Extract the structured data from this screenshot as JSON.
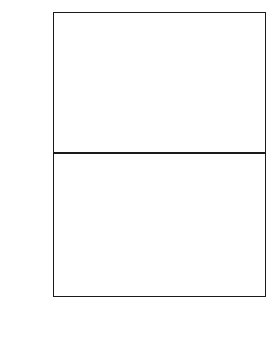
{
  "figure": {
    "xtitle": "Energy",
    "ytitle_top_html": "I<sup>+</sup>+I<sup>-</sup>",
    "ytitle_bottom_html": "(I<sup>+</sup>-I<sup>-</sup>)/(I<sup>+</sup>+I<sup>-</sup>)",
    "background": "#ffffff",
    "curve_color": "#111111",
    "marker_color": "#555555"
  },
  "chart_data": [
    {
      "type": "line",
      "panel": "top",
      "title": "",
      "xlabel": "Energy",
      "ylabel": "I+ + I-",
      "xlim": [
        8.02,
        8.1
      ],
      "ylim": [
        0,
        21500
      ],
      "xticks": [
        8.02,
        8.03,
        8.04,
        8.05,
        8.06,
        8.07,
        8.08,
        8.09,
        8.1
      ],
      "xticklabels": [
        "8.02",
        "8.03",
        "8.04",
        "8.05",
        "8.06",
        "8.07",
        "8.08",
        "8.09",
        "8.10"
      ],
      "yticks": [
        0,
        5000,
        10000,
        15000,
        20000
      ],
      "yticklabels": [
        "0",
        "5000",
        "10000",
        "15000",
        "20000"
      ],
      "minor_ticks_per_major_x": 5,
      "minor_ticks_per_major_y": 2,
      "grid": false,
      "legend": "none",
      "series": [
        {
          "name": "fit",
          "style": "solid-line",
          "x": [
            8.02,
            8.022,
            8.024,
            8.026,
            8.028,
            8.03,
            8.032,
            8.034,
            8.036,
            8.038,
            8.04,
            8.042,
            8.044,
            8.046,
            8.048,
            8.05,
            8.052,
            8.054,
            8.0555,
            8.057,
            8.0585,
            8.06,
            8.0612,
            8.0622,
            8.0632,
            8.0642,
            8.065,
            8.0657,
            8.0663,
            8.0668,
            8.0672,
            8.0676,
            8.068,
            8.0684,
            8.0688,
            8.0692,
            8.0696,
            8.07,
            8.0704,
            8.0708,
            8.0712,
            8.0718,
            8.0724,
            8.073,
            8.0738,
            8.0746,
            8.0755,
            8.0765,
            8.0778,
            8.079,
            8.0805,
            8.082,
            8.084,
            8.086,
            8.088,
            8.09,
            8.093,
            8.096,
            8.099,
            8.1
          ],
          "y": [
            620,
            620,
            625,
            625,
            630,
            630,
            635,
            635,
            640,
            645,
            650,
            660,
            670,
            685,
            705,
            740,
            800,
            930,
            1080,
            1340,
            1800,
            2600,
            3900,
            5200,
            6900,
            8700,
            10100,
            10950,
            11300,
            11450,
            11550,
            11750,
            12100,
            12700,
            13700,
            15200,
            17000,
            18800,
            19900,
            20150,
            19900,
            18600,
            16700,
            14600,
            12200,
            10100,
            8200,
            6400,
            4700,
            3600,
            2700,
            2100,
            1600,
            1300,
            1150,
            1030,
            900,
            830,
            790,
            780
          ]
        },
        {
          "name": "data",
          "style": "open-circles",
          "x": [
            8.0205,
            8.0225,
            8.0245,
            8.0265,
            8.0285,
            8.0305,
            8.0325,
            8.0345,
            8.0365,
            8.0385,
            8.0405,
            8.0425,
            8.0445,
            8.0465,
            8.0485,
            8.0505,
            8.0525,
            8.0545,
            8.0558,
            8.0572,
            8.0588,
            8.0602,
            8.0614,
            8.0624,
            8.0634,
            8.0644,
            8.0652,
            8.0659,
            8.0665,
            8.067,
            8.0674,
            8.0678,
            8.0682,
            8.0686,
            8.069,
            8.0694,
            8.0698,
            8.0702,
            8.0706,
            8.071,
            8.0715,
            8.0721,
            8.0727,
            8.0734,
            8.0742,
            8.075,
            8.076,
            8.0772,
            8.0785,
            8.0798,
            8.0812,
            8.083,
            8.085,
            8.0872,
            8.0895,
            8.092,
            8.095,
            8.0975,
            8.0995
          ],
          "y": [
            640,
            600,
            650,
            610,
            660,
            620,
            670,
            630,
            680,
            640,
            690,
            650,
            700,
            690,
            730,
            760,
            830,
            960,
            1120,
            1400,
            1870,
            2700,
            4050,
            5350,
            7050,
            8900,
            10250,
            11050,
            11350,
            11300,
            11500,
            11900,
            12300,
            12950,
            14000,
            15400,
            17300,
            19050,
            20050,
            20200,
            19700,
            18350,
            16400,
            14350,
            11950,
            9850,
            7980,
            6200,
            4550,
            3480,
            2620,
            2030,
            1560,
            1270,
            1130,
            1010,
            890,
            820,
            800
          ]
        }
      ]
    },
    {
      "type": "line",
      "panel": "bottom",
      "title": "",
      "xlabel": "Energy",
      "ylabel": "(I+ - I-)/(I+ + I-)",
      "xlim": [
        8.02,
        8.1
      ],
      "ylim": [
        -0.2,
        0.8
      ],
      "xticks": [
        8.02,
        8.03,
        8.04,
        8.05,
        8.06,
        8.07,
        8.08,
        8.09,
        8.1
      ],
      "xticklabels": [
        "8.02",
        "8.03",
        "8.04",
        "8.05",
        "8.06",
        "8.07",
        "8.08",
        "8.09",
        "8.10"
      ],
      "yticks": [
        -0.2,
        0.0,
        0.2,
        0.4,
        0.6,
        0.8
      ],
      "yticklabels": [
        "-0.20",
        "0.00",
        "0.20",
        "0.40",
        "0.60",
        "0.80"
      ],
      "minor_ticks_per_major_x": 5,
      "minor_ticks_per_major_y": 2,
      "grid": false,
      "legend": "none",
      "series": [
        {
          "name": "fit",
          "style": "solid-line",
          "x": [
            8.02,
            8.022,
            8.0245,
            8.027,
            8.0295,
            8.032,
            8.0345,
            8.037,
            8.0395,
            8.042,
            8.0445,
            8.0468,
            8.049,
            8.051,
            8.0528,
            8.0545,
            8.056,
            8.0573,
            8.0585,
            8.0596,
            8.0606,
            8.0615,
            8.0623,
            8.063,
            8.0637,
            8.0644,
            8.0651,
            8.0658,
            8.0664,
            8.067,
            8.0676,
            8.0682,
            8.0688,
            8.0694,
            8.07,
            8.0706,
            8.0712,
            8.0719,
            8.0727,
            8.0736,
            8.0746,
            8.0757,
            8.0769,
            8.0782,
            8.0796,
            8.081,
            8.0825,
            8.084,
            8.0855,
            8.087,
            8.089,
            8.091,
            8.093,
            8.095,
            8.097,
            8.099,
            8.1
          ],
          "y": [
            0.634,
            0.633,
            0.631,
            0.628,
            0.624,
            0.619,
            0.613,
            0.605,
            0.596,
            0.585,
            0.57,
            0.552,
            0.528,
            0.5,
            0.468,
            0.428,
            0.382,
            0.33,
            0.272,
            0.208,
            0.142,
            0.078,
            0.02,
            -0.03,
            -0.068,
            -0.09,
            -0.095,
            -0.082,
            -0.05,
            0.01,
            0.105,
            0.23,
            0.37,
            0.5,
            0.6,
            0.658,
            0.67,
            0.645,
            0.588,
            0.512,
            0.43,
            0.345,
            0.268,
            0.2,
            0.145,
            0.105,
            0.072,
            0.048,
            0.035,
            0.03,
            0.045,
            0.075,
            0.11,
            0.15,
            0.19,
            0.232,
            0.25
          ]
        },
        {
          "name": "data",
          "style": "open-circles",
          "x": [
            8.0205,
            8.0228,
            8.0252,
            8.0276,
            8.03,
            8.0324,
            8.0348,
            8.0372,
            8.0396,
            8.042,
            8.0444,
            8.0466,
            8.0488,
            8.0508,
            8.0526,
            8.0543,
            8.0558,
            8.0572,
            8.0584,
            8.0595,
            8.0605,
            8.0614,
            8.0622,
            8.0629,
            8.0636,
            8.0643,
            8.065,
            8.0657,
            8.0663,
            8.0669,
            8.0675,
            8.0681,
            8.0687,
            8.0693,
            8.0699,
            8.0705,
            8.0711,
            8.0718,
            8.0726,
            8.0735,
            8.0745,
            8.0756,
            8.0768,
            8.0781,
            8.0795,
            8.0809,
            8.0824,
            8.0839,
            8.0854,
            8.0869,
            8.0889,
            8.0909,
            8.0929,
            8.0949,
            8.0969,
            8.0989
          ],
          "y": [
            0.648,
            0.625,
            0.612,
            0.622,
            0.604,
            0.592,
            0.6,
            0.578,
            0.572,
            0.564,
            0.548,
            0.54,
            0.512,
            0.49,
            0.452,
            0.42,
            0.37,
            0.322,
            0.262,
            0.198,
            0.136,
            0.07,
            0.012,
            -0.04,
            -0.076,
            -0.098,
            -0.1,
            -0.078,
            -0.042,
            0.022,
            0.118,
            0.245,
            0.382,
            0.512,
            0.612,
            0.672,
            0.66,
            0.628,
            0.572,
            0.498,
            0.418,
            0.33,
            0.252,
            0.186,
            0.128,
            0.09,
            0.05,
            -0.01,
            -0.03,
            0.048,
            0.09,
            0.18,
            0.205,
            0.16,
            0.212,
            0.15
          ]
        }
      ]
    }
  ]
}
